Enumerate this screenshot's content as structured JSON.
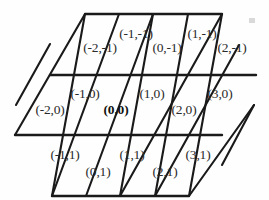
{
  "figure": {
    "name": "triangular-lattice-coordinate-chart",
    "shape": "hexagon",
    "stroke_color": "#1a1a1a",
    "background_color": "#fefefe",
    "label_color": "#2a2a2a",
    "origin_label_color": "#111111"
  },
  "geometry": {
    "hexagon_vertices": [
      [
        85,
        14
      ],
      [
        222,
        14
      ],
      [
        253,
        105
      ],
      [
        188,
        196
      ],
      [
        52,
        196
      ],
      [
        16,
        105
      ]
    ],
    "row_y": [
      14,
      75,
      135,
      196
    ],
    "columns_per_row": [
      4,
      6,
      4
    ]
  },
  "chart_data": {
    "type": "table",
    "title": "",
    "xlabel": "",
    "ylabel": "",
    "rows": [
      {
        "row": -1,
        "cells": [
          "(-2,-1)",
          "(-1,-1)",
          "(0,-1)",
          "(1,-1)",
          "(2,-1)"
        ]
      },
      {
        "row": 0,
        "cells": [
          "(-2,0)",
          "(-1,0)",
          "(0,0)",
          "(1,0)",
          "(2,0)",
          "(3,0)"
        ]
      },
      {
        "row": 1,
        "cells": [
          "(-1,1)",
          "(0,1)",
          "(1,1)",
          "(2,1)",
          "(3,1)"
        ]
      }
    ]
  },
  "cells": [
    {
      "id": "cell-m2-m1",
      "label": "(-2,-1)",
      "x": 100,
      "y": 48,
      "orientation": "up",
      "bold": false
    },
    {
      "id": "cell-m1-m1",
      "label": "(-1,-1)",
      "x": 136,
      "y": 34,
      "orientation": "down",
      "bold": false
    },
    {
      "id": "cell-0-m1",
      "label": "(0,-1)",
      "x": 167,
      "y": 48,
      "orientation": "up",
      "bold": false
    },
    {
      "id": "cell-1-m1",
      "label": "(1,-1)",
      "x": 202,
      "y": 34,
      "orientation": "down",
      "bold": false
    },
    {
      "id": "cell-2-m1",
      "label": "(2,-1)",
      "x": 232,
      "y": 48,
      "orientation": "up",
      "bold": false
    },
    {
      "id": "cell-m2-0",
      "label": "(-2,0)",
      "x": 50,
      "y": 110,
      "orientation": "up",
      "bold": false
    },
    {
      "id": "cell-m1-0",
      "label": "(-1,0)",
      "x": 85,
      "y": 94,
      "orientation": "down",
      "bold": false
    },
    {
      "id": "cell-0-0",
      "label": "(0,0)",
      "x": 116,
      "y": 110,
      "orientation": "up",
      "bold": true
    },
    {
      "id": "cell-1-0",
      "label": "(1,0)",
      "x": 152,
      "y": 94,
      "orientation": "down",
      "bold": false
    },
    {
      "id": "cell-2-0",
      "label": "(2,0)",
      "x": 184,
      "y": 110,
      "orientation": "up",
      "bold": false
    },
    {
      "id": "cell-3-0",
      "label": "(3,0)",
      "x": 220,
      "y": 94,
      "orientation": "down",
      "bold": false
    },
    {
      "id": "cell-m1-1",
      "label": "(-1,1)",
      "x": 65,
      "y": 155,
      "orientation": "down",
      "bold": false
    },
    {
      "id": "cell-0-1",
      "label": "(0,1)",
      "x": 98,
      "y": 172,
      "orientation": "up",
      "bold": false
    },
    {
      "id": "cell-1-1",
      "label": "(1,1)",
      "x": 132,
      "y": 155,
      "orientation": "down",
      "bold": false
    },
    {
      "id": "cell-2-1",
      "label": "(2,1)",
      "x": 165,
      "y": 172,
      "orientation": "up",
      "bold": false
    },
    {
      "id": "cell-3-1",
      "label": "(3,1)",
      "x": 198,
      "y": 155,
      "orientation": "down",
      "bold": false
    }
  ],
  "edges": {
    "horizontal": [
      {
        "name": "top-edge",
        "x1": 85,
        "y1": 14,
        "x2": 222,
        "y2": 14,
        "width": 2.2
      },
      {
        "name": "upper-mid-edge",
        "x1": 50,
        "y1": 75,
        "x2": 256,
        "y2": 75,
        "width": 2.2
      },
      {
        "name": "lower-mid-edge",
        "x1": 16,
        "y1": 135,
        "x2": 222,
        "y2": 135,
        "width": 2.2
      },
      {
        "name": "bottom-edge",
        "x1": 52,
        "y1": 196,
        "x2": 188,
        "y2": 196,
        "width": 2.2
      }
    ],
    "up-right-diagonals": [
      {
        "name": "diag-ur-1",
        "x1": 52,
        "y1": 196,
        "x2": 85,
        "y2": 14,
        "width": 2.0
      },
      {
        "name": "diag-ur-2",
        "x1": 86,
        "y1": 196,
        "x2": 153,
        "y2": 14,
        "width": 2.0
      },
      {
        "name": "diag-ur-3",
        "x1": 120,
        "y1": 196,
        "x2": 222,
        "y2": 14,
        "width": 2.0
      },
      {
        "name": "diag-ur-4",
        "x1": 154,
        "y1": 196,
        "x2": 238,
        "y2": 44,
        "width": 2.0
      },
      {
        "name": "diag-ur-5",
        "x1": 188,
        "y1": 196,
        "x2": 253,
        "y2": 105,
        "width": 2.0
      },
      {
        "name": "diag-ur-6",
        "x1": 16,
        "y1": 105,
        "x2": 50,
        "y2": 44,
        "width": 2.0
      }
    ],
    "down-right-diagonals": [
      {
        "name": "diag-dr-1",
        "x1": 85,
        "y1": 14,
        "x2": 16,
        "y2": 135,
        "width": 2.0
      },
      {
        "name": "diag-dr-2",
        "x1": 119,
        "y1": 14,
        "x2": 52,
        "y2": 196,
        "width": 2.0
      },
      {
        "name": "diag-dr-3",
        "x1": 153,
        "y1": 14,
        "x2": 120,
        "y2": 196,
        "width": 2.0
      },
      {
        "name": "diag-dr-4",
        "x1": 222,
        "y1": 14,
        "x2": 188,
        "y2": 196,
        "width": 2.0
      },
      {
        "name": "diag-dr-5",
        "x1": 253,
        "y1": 105,
        "x2": 222,
        "y2": 165,
        "width": 2.0
      }
    ]
  },
  "artifacts": [
    {
      "name": "scan-speck-top-right",
      "x": 249,
      "y": 18,
      "w": 6,
      "h": 5
    }
  ]
}
